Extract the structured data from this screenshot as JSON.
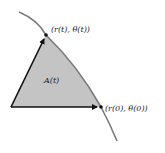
{
  "figure": {
    "region_label": "A(t)",
    "point_t_label": "(r(t), θ(t))",
    "point_0_label": "(r(0), θ(0))",
    "colors": {
      "curve": "#7a7a7a",
      "region_fill": "#c4c4c4",
      "vectors": "#111111",
      "text": "#1a1a1a"
    }
  }
}
